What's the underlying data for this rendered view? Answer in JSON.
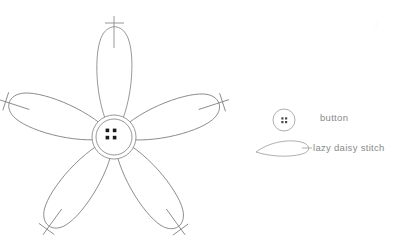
{
  "page": {
    "background_color": "#ffffff",
    "width": 409,
    "height": 247
  },
  "diagram": {
    "name": "five-petal-daisy-with-button-center",
    "stroke_color": "#7d7d7d",
    "dot_color": "#1a1a1a",
    "stroke_width": 0.8,
    "center": {
      "x": 114,
      "y": 137,
      "outer_radius": 22,
      "inner_radius": 18
    },
    "button_dots": [
      {
        "x": 108,
        "y": 131
      },
      {
        "x": 118,
        "y": 131
      },
      {
        "x": 108,
        "y": 141
      },
      {
        "x": 118,
        "y": 141
      }
    ],
    "petal_count": 5,
    "petals": [
      {
        "name": "petal-top",
        "angle_deg": -90,
        "length": 112,
        "width": 42,
        "tack_angle_deg": -90
      },
      {
        "name": "petal-upper-right",
        "angle_deg": -18,
        "length": 118,
        "width": 42,
        "tack_angle_deg": -18
      },
      {
        "name": "petal-lower-right",
        "angle_deg": 54,
        "length": 118,
        "width": 42,
        "tack_angle_deg": 54
      },
      {
        "name": "petal-lower-left",
        "angle_deg": 126,
        "length": 118,
        "width": 42,
        "tack_angle_deg": 126
      },
      {
        "name": "petal-upper-left",
        "angle_deg": 198,
        "length": 118,
        "width": 42,
        "tack_angle_deg": 198
      }
    ]
  },
  "legend": {
    "name": "pattern-key",
    "text_color": "#8a8a8a",
    "items": [
      {
        "key": "button",
        "label": "button",
        "symbol": "button-circle-with-four-holes",
        "symbol_center": {
          "x": 284,
          "y": 120
        },
        "symbol_radius": 11
      },
      {
        "key": "lazy-daisy-stitch",
        "label": "lazy daisy stitch",
        "symbol": "teardrop-petal-outline",
        "symbol_center": {
          "x": 283,
          "y": 150
        },
        "symbol_length": 55,
        "symbol_width": 16
      }
    ]
  }
}
